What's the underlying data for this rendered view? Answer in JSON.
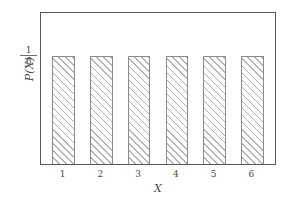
{
  "chart_data": {
    "type": "bar",
    "title": "",
    "subtitle": "",
    "xlabel": "X",
    "ylabel": "P(X)",
    "categories": [
      "1",
      "2",
      "3",
      "4",
      "5",
      "6"
    ],
    "values": [
      0.1667,
      0.1667,
      0.1667,
      0.1667,
      0.1667,
      0.1667
    ],
    "value_labels": [
      "1/6",
      "1/6",
      "1/6",
      "1/6",
      "1/6",
      "1/6"
    ],
    "series": [
      {
        "name": "P(X)",
        "values": [
          0.1667,
          0.1667,
          0.1667,
          0.1667,
          0.1667,
          0.1667
        ]
      }
    ],
    "xlim": [
      0.4,
      6.6
    ],
    "ylim": [
      0,
      0.2333
    ],
    "ytick_values": [
      0.1667
    ],
    "ytick_labels": [
      "1/6"
    ],
    "ytick_fraction": {
      "numerator": "1",
      "denominator": "6"
    },
    "xtick_labels": [
      "1",
      "2",
      "3",
      "4",
      "5",
      "6"
    ],
    "grid": false,
    "legend": null,
    "legend_position": "none",
    "bar_style": {
      "fill": "#ffffff",
      "edge_color": "#8a8a8a",
      "hatch": "///",
      "hatch_color": "#b4b4b4"
    },
    "frame_color": "#585858",
    "text_color": "#4a4a4a",
    "background": "#ffffff",
    "annotations": []
  }
}
